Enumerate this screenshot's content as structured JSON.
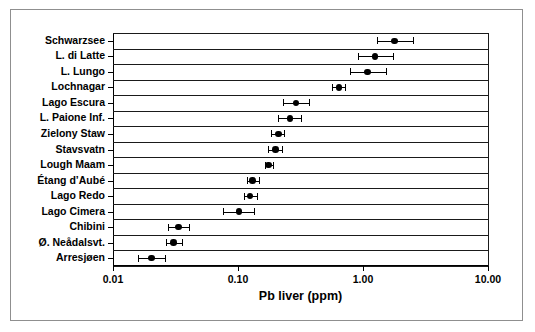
{
  "chart_data": {
    "type": "scatter",
    "orientation": "horizontal",
    "title": "",
    "xlabel": "Pb liver (ppm)",
    "ylabel": "",
    "xscale": "log",
    "xlim": [
      0.01,
      10.0
    ],
    "xticks": [
      0.01,
      0.1,
      1.0,
      10.0
    ],
    "xticklabels": [
      "0.01",
      "0.10",
      "1.00",
      "10.00"
    ],
    "grid": false,
    "legend": null,
    "categories": [
      "Schwarzsee",
      "L. di Latte",
      "L. Lungo",
      "Lochnagar",
      "Lago Escura",
      "L. Paione Inf.",
      "Zielony Staw",
      "Stavsvatn",
      "Lough Maam",
      "Étang d’Aubé",
      "Lago Redo",
      "Lago Cimera",
      "Chibini",
      "Ø. Neådalsvt.",
      "Arresjøen"
    ],
    "values": [
      1.78,
      1.25,
      1.09,
      0.64,
      0.29,
      0.26,
      0.21,
      0.2,
      0.176,
      0.131,
      0.125,
      0.102,
      0.0335,
      0.0305,
      0.0204
    ],
    "err_low": [
      1.29,
      0.92,
      0.79,
      0.57,
      0.23,
      0.21,
      0.185,
      0.175,
      0.164,
      0.117,
      0.111,
      0.0765,
      0.0275,
      0.0265,
      0.0159
    ],
    "err_high": [
      2.52,
      1.74,
      1.53,
      0.72,
      0.37,
      0.32,
      0.235,
      0.225,
      0.189,
      0.147,
      0.141,
      0.135,
      0.0405,
      0.0355,
      0.0262
    ],
    "marker": "filled-circle",
    "errorbar_style": "capped"
  }
}
